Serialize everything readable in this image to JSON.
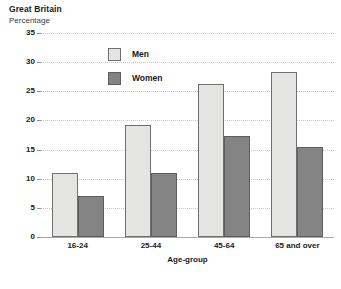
{
  "header": {
    "title": "Great Britain",
    "subtitle": "Percentage"
  },
  "chart_data": {
    "type": "bar",
    "title": "Great Britain",
    "subtitle": "Percentage",
    "xlabel": "Age-group",
    "ylabel": "Percentage",
    "categories": [
      "16-24",
      "25-44",
      "45-64",
      "65 and over"
    ],
    "series": [
      {
        "name": "Men",
        "color": "#e4e4e2",
        "values": [
          11.0,
          19.2,
          26.2,
          28.3
        ]
      },
      {
        "name": "Women",
        "color": "#848484",
        "values": [
          7.0,
          11.0,
          17.3,
          15.5
        ]
      }
    ],
    "ylim": [
      0,
      35
    ],
    "yticks": [
      0,
      5,
      10,
      15,
      20,
      25,
      30,
      35
    ],
    "ytick_labels": [
      "0",
      "5",
      "10",
      "15",
      "20",
      "25",
      "30",
      "35"
    ],
    "grid": true,
    "legend_position": "inside-top-left"
  },
  "legend": {
    "men_label": "Men",
    "women_label": "Women"
  },
  "axes": {
    "x_title": "Age-group"
  }
}
